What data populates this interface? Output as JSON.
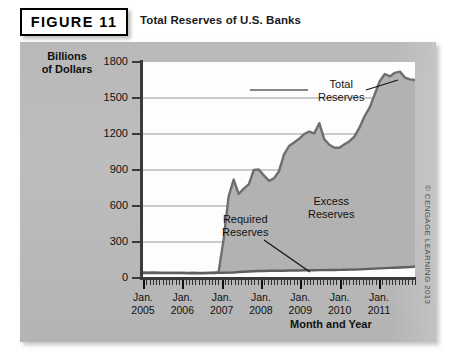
{
  "figure": {
    "badge_label": "FIGURE 11",
    "title": "Total Reserves of U.S. Banks",
    "credit": "© CENGAGE LEARNING 2013"
  },
  "chart_data": {
    "type": "area",
    "title": "Total Reserves of U.S. Banks",
    "xlabel": "Month and Year",
    "ylabel": "Billions of Dollars",
    "ylim": [
      0,
      1800
    ],
    "yticks": [
      0,
      300,
      600,
      900,
      1200,
      1500,
      1800
    ],
    "xlim": [
      "Jan. 2005",
      "Dec. 2011"
    ],
    "xticks": [
      "Jan. 2005",
      "Jan. 2006",
      "Jan. 2007",
      "Jan. 2008",
      "Jan. 2009",
      "Jan. 2010",
      "Jan. 2011"
    ],
    "grid": true,
    "legend_position": "in-plot annotations",
    "annotations": [
      {
        "name": "total-reserves",
        "text": "Total\nReserves",
        "line1": "Total",
        "line2": "Reserves"
      },
      {
        "name": "excess-reserves",
        "text": "Excess\nReserves",
        "line1": "Excess",
        "line2": "Reserves"
      },
      {
        "name": "required-reserves",
        "text": "Required\nReserves",
        "line1": "Required",
        "line2": "Reserves"
      }
    ],
    "colors": {
      "fill": "#b2b2b2",
      "line": "#6b6b6b",
      "panel": "#bcbcbc",
      "plot_background": "#fdfdfd",
      "axis": "#3a3a3a",
      "grid": "#8f8f8f"
    },
    "x": [
      "2005-01",
      "2005-04",
      "2005-07",
      "2005-10",
      "2006-01",
      "2006-04",
      "2006-07",
      "2006-10",
      "2007-01",
      "2007-04",
      "2007-07",
      "2007-10",
      "2008-01",
      "2008-04",
      "2008-07",
      "2008-09",
      "2008-10",
      "2008-11",
      "2008-12",
      "2009-01",
      "2009-02",
      "2009-03",
      "2009-04",
      "2009-05",
      "2009-06",
      "2009-07",
      "2009-08",
      "2009-09",
      "2009-10",
      "2009-11",
      "2009-12",
      "2010-01",
      "2010-02",
      "2010-03",
      "2010-04",
      "2010-05",
      "2010-06",
      "2010-07",
      "2010-08",
      "2010-09",
      "2010-10",
      "2010-11",
      "2010-12",
      "2011-01",
      "2011-02",
      "2011-03",
      "2011-04",
      "2011-05",
      "2011-06",
      "2011-07",
      "2011-08",
      "2011-09",
      "2011-10",
      "2011-11",
      "2011-12"
    ],
    "series": [
      {
        "name": "Total Reserves",
        "values": [
          46,
          45,
          46,
          45,
          45,
          44,
          45,
          44,
          44,
          43,
          44,
          43,
          43,
          44,
          45,
          48,
          320,
          680,
          820,
          700,
          745,
          780,
          900,
          905,
          855,
          810,
          830,
          890,
          1030,
          1100,
          1130,
          1160,
          1200,
          1220,
          1205,
          1290,
          1155,
          1110,
          1085,
          1085,
          1115,
          1140,
          1180,
          1255,
          1350,
          1420,
          1530,
          1640,
          1700,
          1680,
          1710,
          1720,
          1670,
          1655,
          1650
        ]
      },
      {
        "name": "Required Reserves",
        "values": [
          42,
          42,
          42,
          42,
          41,
          41,
          41,
          41,
          41,
          40,
          41,
          40,
          40,
          41,
          42,
          43,
          44,
          45,
          46,
          50,
          52,
          54,
          56,
          58,
          58,
          60,
          60,
          60,
          61,
          62,
          62,
          63,
          64,
          64,
          65,
          66,
          66,
          67,
          67,
          68,
          69,
          70,
          70,
          72,
          74,
          76,
          78,
          80,
          82,
          84,
          86,
          88,
          90,
          92,
          95
        ]
      }
    ]
  }
}
